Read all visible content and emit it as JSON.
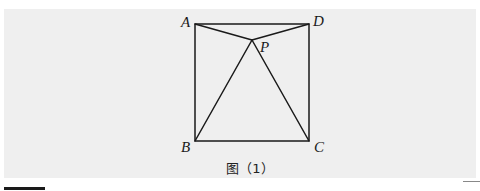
{
  "figure": {
    "caption": "图（1）",
    "background_color": "#efefef",
    "line_color": "#1a1a1a",
    "points": {
      "A": {
        "label": "A",
        "x": 195,
        "y": 24
      },
      "D": {
        "label": "D",
        "x": 309,
        "y": 24
      },
      "B": {
        "label": "B",
        "x": 195,
        "y": 141
      },
      "C": {
        "label": "C",
        "x": 309,
        "y": 141
      },
      "P": {
        "label": "P",
        "x": 252,
        "y": 40
      }
    },
    "segments": [
      "AD",
      "DC",
      "CB",
      "BA",
      "AP",
      "DP",
      "BP",
      "CP"
    ]
  }
}
